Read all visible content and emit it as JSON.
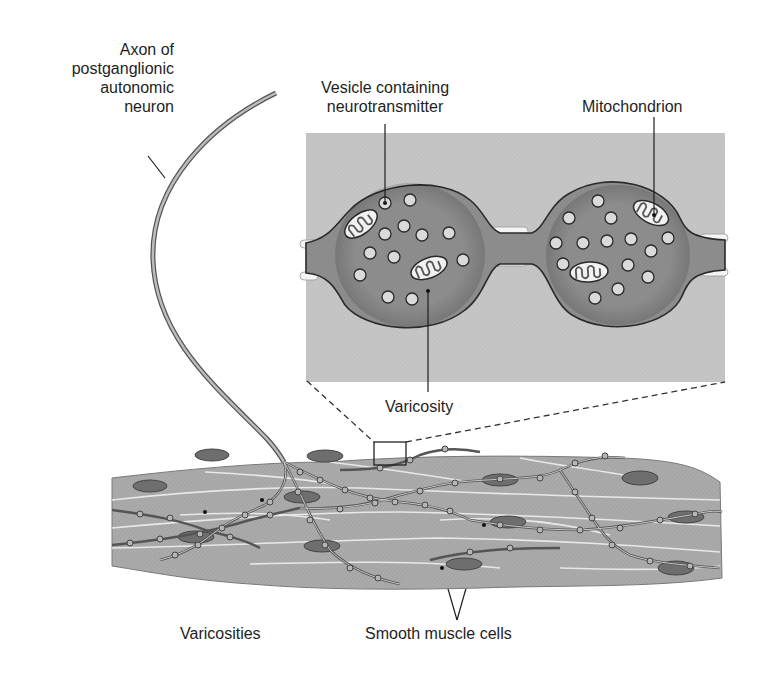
{
  "diagram": {
    "labels": {
      "axon": [
        "Axon of",
        "postganglionic",
        "autonomic",
        "neuron"
      ],
      "vesicle": [
        "Vesicle containing",
        "neurotransmitter"
      ],
      "mitochondrion": "Mitochondrion",
      "varicosity": "Varicosity",
      "varicosities": "Varicosities",
      "smooth_muscle": "Smooth muscle cells"
    },
    "colors": {
      "inset_bg": "#c9c9c9",
      "varicosity_fill": "#8d8d8d",
      "vesicle_fill": "#d8d8d8",
      "muscle_fill": "#a9a9a9",
      "nucleus_fill": "#6e6e6e",
      "outline": "#2a2a2a"
    }
  }
}
